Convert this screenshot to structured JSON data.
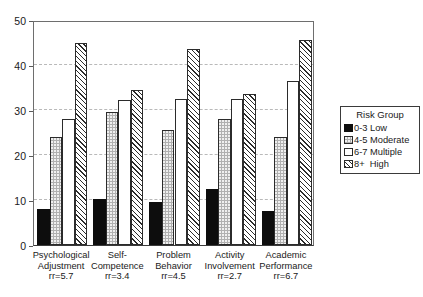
{
  "chart_data": {
    "type": "bar",
    "title": "",
    "xlabel": "",
    "ylabel": "",
    "ylim": [
      0,
      50
    ],
    "yticks": [
      0,
      10,
      20,
      30,
      40,
      50
    ],
    "grid": true,
    "legend_position": "right",
    "categories": [
      "Psychological\nAdjustment\nrr=5.7",
      "Self-\nCompetence\nrr=3.4",
      "Problem\nBehavior\nrr=4.5",
      "Activity\nInvolvement\nrr=2.7",
      "Academic\nPerformance\nrr=6.7"
    ],
    "category_names": [
      "Psychological Adjustment",
      "Self-Competence",
      "Problem Behavior",
      "Activity Involvement",
      "Academic Performance"
    ],
    "category_rr": [
      "rr=5.7",
      "rr=3.4",
      "rr=4.5",
      "rr=2.7",
      "rr=6.7"
    ],
    "legend_title": "Risk Group",
    "series": [
      {
        "name": "0-3 Low",
        "key": "low",
        "values": [
          8.0,
          10.3,
          9.5,
          12.5,
          7.5
        ]
      },
      {
        "name": "4-5 Moderate",
        "key": "moderate",
        "values": [
          24.0,
          29.5,
          25.5,
          28.0,
          24.0
        ]
      },
      {
        "name": "6-7 Multiple",
        "key": "multiple",
        "values": [
          28.0,
          32.3,
          32.5,
          32.5,
          36.5
        ]
      },
      {
        "name": "8+  High",
        "key": "high",
        "values": [
          45.0,
          34.5,
          43.5,
          33.5,
          45.5
        ]
      }
    ]
  },
  "colors": {
    "low": "#0d0d0d",
    "moderate": "#b0b0b0",
    "multiple": "#ffffff",
    "high": "#ffffff",
    "axis": "#3a3a3a",
    "grid": "#b9b9b9"
  }
}
